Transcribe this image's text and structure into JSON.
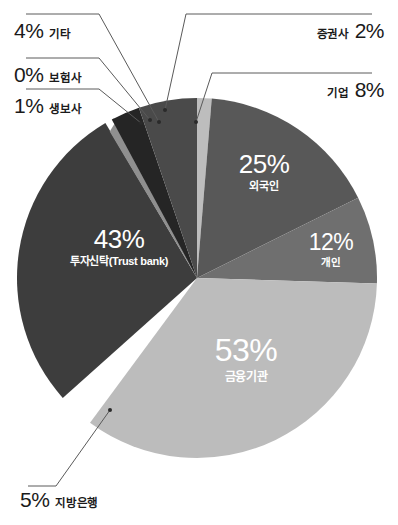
{
  "chart_data": {
    "type": "pie",
    "title": "",
    "subtitle": "",
    "xlabel": "",
    "ylabel": "",
    "legend_position": "none",
    "grid": false,
    "units": "%",
    "center": {
      "x": 197,
      "y": 278
    },
    "radius": 180,
    "start_angle_deg": -90,
    "slices": [
      {
        "key": "securities",
        "label": "증권사",
        "value": 2,
        "display": "2%",
        "color": "#bdbdbd",
        "label_placement": "callout-right"
      },
      {
        "key": "foreign",
        "label": "외국인",
        "value": 25,
        "display": "25%",
        "color": "#585858",
        "label_placement": "inside"
      },
      {
        "key": "corporate",
        "label": "기업",
        "value": 8,
        "display": "8%",
        "color": "#4a4a4a",
        "label_placement": "callout-right"
      },
      {
        "key": "person",
        "label": "개인",
        "value": 12,
        "display": "12%",
        "color": "#6f6f6f",
        "label_placement": "inside"
      },
      {
        "key": "finance",
        "label": "금융기관",
        "value": 53,
        "display": "53%",
        "color": "#bcbcbc",
        "label_placement": "inside"
      },
      {
        "key": "local_bank",
        "label": "지방은행",
        "value": 5,
        "display": "5%",
        "color": "#6f6f6f",
        "label_placement": "callout-bottom"
      },
      {
        "key": "trust",
        "label": "투자신탁(Trust bank)",
        "value": 43,
        "display": "43%",
        "color": "#3d3d3d",
        "label_placement": "inside"
      },
      {
        "key": "life_ins",
        "label": "생보사",
        "value": 1,
        "display": "1%",
        "color": "#8f8f8f",
        "label_placement": "callout-left"
      },
      {
        "key": "insurance",
        "label": "보험사",
        "value": 0,
        "display": "0%",
        "color": "#a8a8a8",
        "label_placement": "callout-left"
      },
      {
        "key": "etc",
        "label": "기타",
        "value": 4,
        "display": "4%",
        "color": "#252525",
        "label_placement": "callout-left"
      }
    ]
  },
  "callouts": {
    "etc": {
      "pct": "4%",
      "name": "기타"
    },
    "insurance": {
      "pct": "0%",
      "name": "보험사"
    },
    "life": {
      "pct": "1%",
      "name": "생보사"
    },
    "securities": {
      "pct": "2%",
      "name": "증권사"
    },
    "corporate": {
      "pct": "8%",
      "name": "기업"
    },
    "local_bank": {
      "pct": "5%",
      "name": "지방은행"
    }
  },
  "inside_labels": {
    "foreign": {
      "pct": "25%",
      "name": "외국인"
    },
    "person": {
      "pct": "12%",
      "name": "개인"
    },
    "finance": {
      "pct": "53%",
      "name": "금융기관"
    },
    "trust": {
      "pct": "43%",
      "name": "투자신탁(Trust bank)"
    }
  },
  "colors": {
    "background": "#ffffff",
    "text": "#1a1a1a",
    "inside_text": "#ffffff",
    "leader_line": "#5a5a5a",
    "slice_darkest": "#252525",
    "slice_dark": "#3d3d3d",
    "slice_mid_dark": "#4a4a4a",
    "slice_mid": "#585858",
    "slice_gray": "#6f6f6f",
    "slice_light": "#bcbcbc",
    "slice_lightest": "#bdbdbd"
  }
}
